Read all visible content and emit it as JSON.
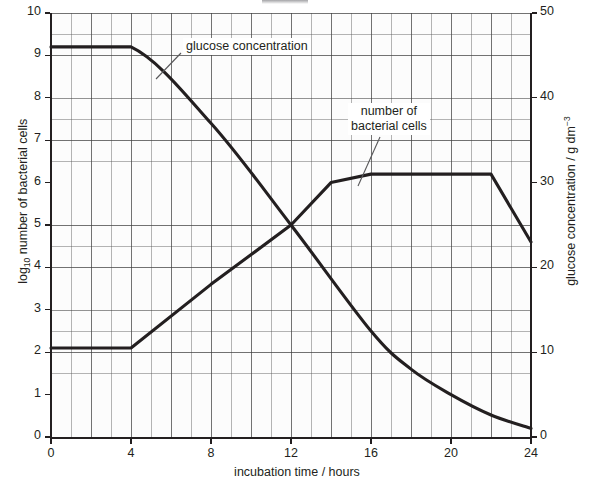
{
  "chart_data": {
    "type": "line",
    "title": "",
    "xlabel": "incubation time / hours",
    "ylabel_left": "log10 number of bacterial cells",
    "ylabel_right": "glucose concentration / g dm-3",
    "xlim": [
      0,
      24
    ],
    "xticks": [
      0,
      4,
      8,
      12,
      16,
      20,
      24
    ],
    "ylim_left": [
      0,
      10
    ],
    "yticks_left": [
      0,
      1,
      2,
      3,
      4,
      5,
      6,
      7,
      8,
      9,
      10
    ],
    "ylim_right": [
      0,
      50
    ],
    "yticks_right": [
      0,
      10,
      20,
      30,
      40,
      50
    ],
    "grid": "fine graph paper, major gridlines every 1 unit on left axis and every 4 hours",
    "legend": "none (curves labelled with leader lines)",
    "series": [
      {
        "name": "number of bacterial cells",
        "axis": "left",
        "units": "log10 cells",
        "points": [
          {
            "x": 0,
            "y": 2.1
          },
          {
            "x": 4,
            "y": 2.1
          },
          {
            "x": 8,
            "y": 3.6
          },
          {
            "x": 12,
            "y": 5.0
          },
          {
            "x": 14,
            "y": 6.0
          },
          {
            "x": 16,
            "y": 6.2
          },
          {
            "x": 20,
            "y": 6.2
          },
          {
            "x": 22,
            "y": 6.2
          },
          {
            "x": 24,
            "y": 4.6
          }
        ]
      },
      {
        "name": "glucose concentration",
        "axis": "right",
        "units": "g dm-3",
        "points": [
          {
            "x": 0,
            "y": 46.0
          },
          {
            "x": 4,
            "y": 46.0
          },
          {
            "x": 8,
            "y": 37.0
          },
          {
            "x": 12,
            "y": 25.0
          },
          {
            "x": 16,
            "y": 12.5
          },
          {
            "x": 18,
            "y": 8.0
          },
          {
            "x": 20,
            "y": 5.0
          },
          {
            "x": 22,
            "y": 2.6
          },
          {
            "x": 24,
            "y": 1.0
          }
        ]
      }
    ]
  },
  "axes": {
    "left_ticks": [
      "0",
      "1",
      "2",
      "3",
      "4",
      "5",
      "6",
      "7",
      "8",
      "9",
      "10"
    ],
    "right_ticks": [
      "0",
      "10",
      "20",
      "30",
      "40",
      "50"
    ],
    "bottom_ticks": [
      "0",
      "4",
      "8",
      "12",
      "16",
      "20",
      "24"
    ],
    "left_title_main": "log",
    "left_title_sub": "10",
    "left_title_rest": " number of bacterial cells",
    "right_title_main": "glucose concentration / g dm",
    "right_title_sup": "−3",
    "bottom_title": "incubation time / hours"
  },
  "annotations": {
    "glucose_label": "glucose concentration",
    "bacteria_label_line1": "number of",
    "bacteria_label_line2": "bacterial cells"
  },
  "colors": {
    "curve": "#231f20",
    "axis": "#231f20",
    "grid_minor": "#9a9a9a",
    "grid_major": "#5a5a5a",
    "background": "#ffffff",
    "plot_background": "#fcfcfc"
  }
}
